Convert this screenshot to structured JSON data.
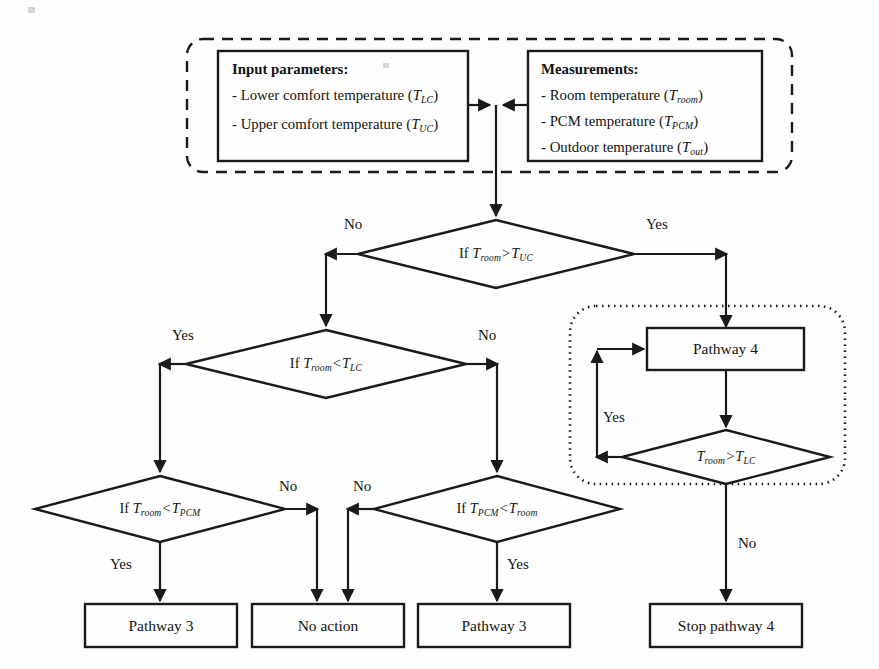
{
  "figure": {
    "type": "flowchart",
    "colors": {
      "stroke": "#1a1a1a",
      "text": "#141414",
      "background": "#fefefe"
    }
  },
  "input_panel": {
    "name": "dashed-container",
    "border_style": "dashed",
    "blocks": [
      {
        "name": "input-parameters-box",
        "title": "Input parameters:",
        "lines": [
          {
            "prefix": "- Lower comfort temperature (",
            "var": "T",
            "sub": "LC",
            "suffix": ")"
          },
          {
            "prefix": "- Upper comfort temperature (",
            "var": "T",
            "sub": "UC",
            "suffix": ")"
          }
        ]
      },
      {
        "name": "measurements-box",
        "title": "Measurements:",
        "lines": [
          {
            "prefix": "- Room temperature (",
            "var": "T",
            "sub": "room",
            "suffix": ")"
          },
          {
            "prefix": "- PCM temperature (",
            "var": "T",
            "sub": "PCM",
            "suffix": ")"
          },
          {
            "prefix": "- Outdoor temperature (",
            "var": "T",
            "sub": "out",
            "suffix": ")"
          }
        ]
      }
    ]
  },
  "decisions": [
    {
      "id": "d1",
      "name": "decision-room-gt-uc",
      "prefix": "If ",
      "lhs_var": "T",
      "lhs_sub": "room",
      "op": ">",
      "rhs_var": "T",
      "rhs_sub": "UC",
      "branches": {
        "left": "No",
        "right": "Yes"
      }
    },
    {
      "id": "d2",
      "name": "decision-room-lt-lc",
      "prefix": "If ",
      "lhs_var": "T",
      "lhs_sub": "room",
      "op": "<",
      "rhs_var": "T",
      "rhs_sub": "LC",
      "branches": {
        "left": "Yes",
        "right": "No"
      }
    },
    {
      "id": "d3",
      "name": "decision-room-lt-pcm",
      "prefix": "If ",
      "lhs_var": "T",
      "lhs_sub": "room",
      "op": "<",
      "rhs_var": "T",
      "rhs_sub": "PCM",
      "branches": {
        "right": "No",
        "bottom": "Yes"
      }
    },
    {
      "id": "d4",
      "name": "decision-pcm-lt-room",
      "prefix": "If ",
      "lhs_var": "T",
      "lhs_sub": "PCM",
      "op": "<",
      "rhs_var": "T",
      "rhs_sub": "room",
      "branches": {
        "left": "No",
        "bottom": "Yes"
      }
    },
    {
      "id": "d5",
      "name": "decision-room-gt-lc-loop",
      "prefix": "",
      "lhs_var": "T",
      "lhs_sub": "room",
      "op": ">",
      "rhs_var": "T",
      "rhs_sub": "LC",
      "branches": {
        "left": "Yes",
        "bottom": "No"
      }
    }
  ],
  "terminals": [
    {
      "id": "p4",
      "name": "process-pathway-4",
      "label": "Pathway 4"
    },
    {
      "id": "p3a",
      "name": "terminal-pathway-3-left",
      "label": "Pathway 3"
    },
    {
      "id": "na",
      "name": "terminal-no-action",
      "label": "No action"
    },
    {
      "id": "p3b",
      "name": "terminal-pathway-3-right",
      "label": "Pathway 3"
    },
    {
      "id": "sp4",
      "name": "terminal-stop-pathway-4",
      "label": "Stop pathway 4"
    }
  ],
  "loop_group": {
    "name": "dotted-loop-container",
    "border_style": "dotted"
  },
  "edge_labels": {
    "d1_no": "No",
    "d1_yes": "Yes",
    "d2_yes": "Yes",
    "d2_no": "No",
    "d3_no": "No",
    "d3_yes": "Yes",
    "d4_no": "No",
    "d4_yes": "Yes",
    "d5_yes": "Yes",
    "d5_no": "No"
  }
}
